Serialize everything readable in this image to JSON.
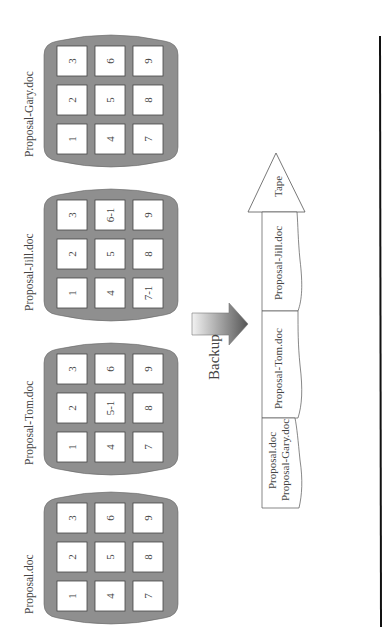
{
  "documents": [
    {
      "name": "Proposal-Gary.doc",
      "blocks": [
        "1",
        "2",
        "3",
        "4",
        "5",
        "6",
        "7",
        "8",
        "9"
      ]
    },
    {
      "name": "Proposal-Jill.doc",
      "blocks": [
        "1",
        "2",
        "3",
        "4",
        "5",
        "6-1",
        "7-1",
        "8",
        "9"
      ]
    },
    {
      "name": "Proposal-Tom.doc",
      "blocks": [
        "1",
        "2",
        "3",
        "4",
        "5-1",
        "6",
        "7",
        "8",
        "9"
      ]
    },
    {
      "name": "Proposal.doc",
      "blocks": [
        "1",
        "2",
        "3",
        "4",
        "5",
        "6",
        "7",
        "8",
        "9"
      ]
    }
  ],
  "backup_label": "Backup",
  "tape": {
    "label": "Tape",
    "segments": [
      {
        "lines": [
          "Proposal-Jill.doc"
        ]
      },
      {
        "lines": [
          "Proposal-Tom.doc"
        ]
      },
      {
        "lines": [
          "Proposal.doc",
          "Proposal-Gary.doc"
        ]
      }
    ]
  },
  "colors": {
    "container_fill": "#8f8f8f",
    "block_fill": "#ffffff",
    "stroke": "#444444",
    "divider_line": "#111111"
  }
}
